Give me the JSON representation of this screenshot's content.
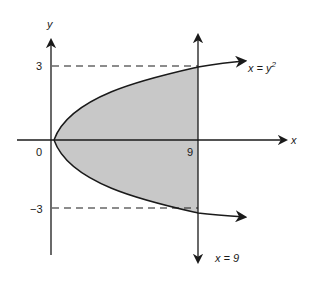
{
  "diagram": {
    "type": "region between parabola and vertical line",
    "axis_labels": {
      "x": "x",
      "y": "y"
    },
    "ticks": {
      "origin": "0",
      "x_nine": "9",
      "y_three": "3",
      "y_neg_three": "−3"
    },
    "curves": [
      {
        "name": "parabola",
        "equation_lhs": "x = y",
        "exponent": "2"
      },
      {
        "name": "vertical-line",
        "equation": "x = 9"
      }
    ],
    "shaded_region": "0 ≤ x ≤ 9, y² ≤ x",
    "colors": {
      "shade": "#c8c8c8",
      "stroke": "#1a1a1a"
    }
  }
}
